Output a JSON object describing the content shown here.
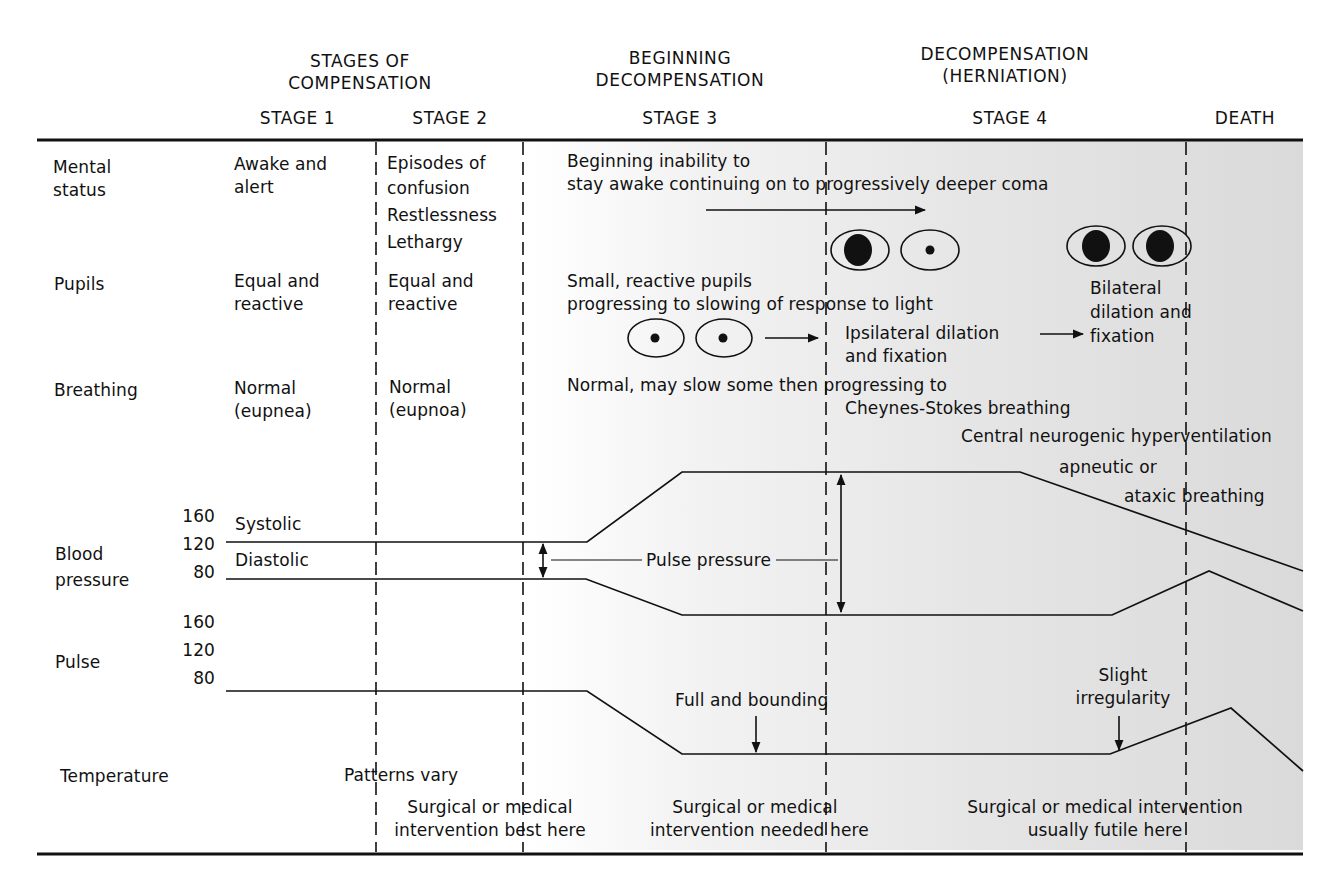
{
  "title_groups": [
    {
      "line1": "STAGES OF",
      "line2": "COMPENSATION"
    },
    {
      "line1": "BEGINNING",
      "line2": "DECOMPENSATION"
    },
    {
      "line1": "DECOMPENSATION",
      "line2": "(HERNIATION)"
    }
  ],
  "stages": [
    "STAGE 1",
    "STAGE 2",
    "STAGE 3",
    "STAGE 4",
    "DEATH"
  ],
  "row_labels": {
    "mental_status": [
      "Mental",
      "status"
    ],
    "pupils": "Pupils",
    "breathing": "Breathing",
    "blood_pressure": [
      "Blood",
      "pressure"
    ],
    "pulse": "Pulse",
    "temperature": "Temperature"
  },
  "mental_status": {
    "stage1": [
      "Awake and",
      "alert"
    ],
    "stage2": [
      "Episodes of",
      "confusion",
      "Restlessness",
      "Lethargy"
    ],
    "stage3": [
      "Beginning inability to",
      "stay awake continuing on to progressively deeper coma"
    ]
  },
  "pupils": {
    "stage1": [
      "Equal and",
      "reactive"
    ],
    "stage2": [
      "Equal and",
      "reactive"
    ],
    "stage3": [
      "Small, reactive pupils",
      "progressing to slowing of response to light"
    ],
    "ipsilateral": [
      "Ipsilateral dilation",
      "and fixation"
    ],
    "bilateral": [
      "Bilateral",
      "dilation and",
      "fixation"
    ]
  },
  "breathing": {
    "stage1": [
      "Normal",
      "(eupnea)"
    ],
    "stage2": [
      "Normal",
      "(eupnoa)"
    ],
    "stage3": [
      "Normal, may slow some then progressing to",
      "Cheynes-Stokes breathing"
    ],
    "stage4a": "Central neurogenic hyperventilation",
    "stage4b": [
      "apneutic or",
      "ataxic breathing"
    ]
  },
  "bp_axis": [
    "160",
    "120",
    "80"
  ],
  "bp_labels": {
    "systolic": "Systolic",
    "diastolic": "Diastolic",
    "pulse_pressure": "Pulse pressure"
  },
  "pulse_axis": [
    "160",
    "120",
    "80"
  ],
  "pulse_labels": {
    "full": "Full and bounding",
    "slight": [
      "Slight",
      "irregularity"
    ]
  },
  "temperature": {
    "note": "Patterns vary"
  },
  "interventions": [
    [
      "Surgical or medical",
      "intervention best here"
    ],
    [
      "Surgical or medical",
      "intervention needed here"
    ],
    [
      "Surgical or medical intervention",
      "usually futile here"
    ]
  ],
  "colors": {
    "ink": "#111111",
    "shade": "#dadada"
  }
}
